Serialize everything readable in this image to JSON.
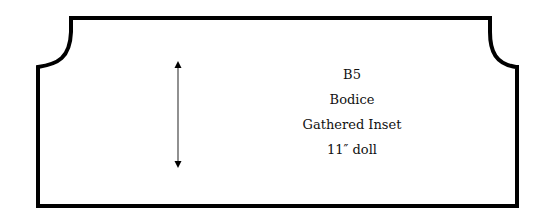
{
  "pattern_piece": {
    "code": "B5",
    "piece_name": "Bodice",
    "style": "Gathered Inset",
    "size": "11″ doll",
    "grainline": "grainline-arrow-vertical",
    "outline_color": "#000000",
    "grainline_color": "#555555"
  }
}
